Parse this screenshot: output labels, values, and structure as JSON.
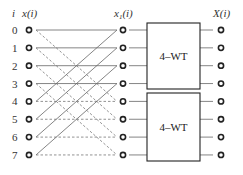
{
  "headers": {
    "index": "i",
    "input": "x(i)",
    "intermediate": "x",
    "intermediate_sub": "1",
    "intermediate_arg": "(i)",
    "output": "X(i)"
  },
  "rows": [
    "0",
    "1",
    "2",
    "3",
    "4",
    "5",
    "6",
    "7"
  ],
  "blocks": [
    {
      "label": "4–WT",
      "rows": [
        0,
        1,
        2,
        3
      ]
    },
    {
      "label": "4–WT",
      "rows": [
        4,
        5,
        6,
        7
      ]
    }
  ],
  "connections": {
    "solid": "x1(k) = x(k) + x(k+4), k = 0..3",
    "dashed": "x1(k+4) = x(k) − x(k+4), k = 0..3"
  },
  "colors": {
    "line": "#666666",
    "node": "#222222",
    "text": "#333333"
  }
}
